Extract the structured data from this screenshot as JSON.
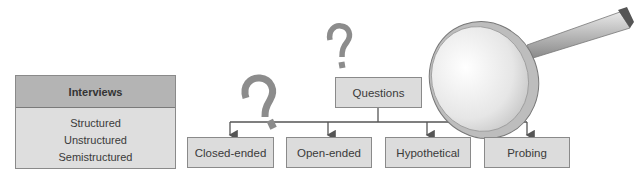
{
  "interviews": {
    "title": "Interviews",
    "types": [
      "Structured",
      "Unstructured",
      "Semistructured"
    ]
  },
  "questions": {
    "root": "Questions",
    "types": [
      "Closed-ended",
      "Open-ended",
      "Hypothetical",
      "Probing"
    ]
  },
  "icons": [
    "question-mark-icon",
    "question-mark-icon",
    "magnifying-glass-icon"
  ],
  "colors": {
    "box_fill": "#dcdcdc",
    "header_fill": "#b4b4b4",
    "border": "#8a8a8a",
    "line": "#555555",
    "question_mark": "#8c8c8c"
  }
}
